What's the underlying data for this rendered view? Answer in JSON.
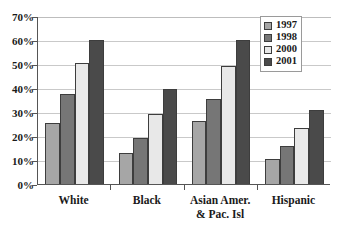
{
  "chart_data": {
    "type": "bar",
    "title": "",
    "subtitle": "",
    "xlabel": "",
    "ylabel": "",
    "categories": [
      "White",
      "Black",
      "Asian Amer. & Pac. Isl",
      "Hispanic"
    ],
    "category_lines": [
      [
        "White"
      ],
      [
        "Black"
      ],
      [
        "Asian Amer.",
        "& Pac. Isl"
      ],
      [
        "Hispanic"
      ]
    ],
    "series": [
      {
        "name": "1997",
        "color": "#a6a6a6",
        "values": [
          25.3,
          13.0,
          26.2,
          10.6
        ]
      },
      {
        "name": "1998",
        "color": "#767676",
        "values": [
          37.7,
          19.0,
          35.6,
          16.0
        ]
      },
      {
        "name": "2000",
        "color": "#e8e8e8",
        "values": [
          50.5,
          29.0,
          49.0,
          23.2
        ]
      },
      {
        "name": "2001",
        "color": "#4a4a4a",
        "values": [
          60.0,
          39.6,
          60.2,
          31.0
        ]
      }
    ],
    "ylim": [
      0,
      70
    ],
    "yticks": [
      0,
      10,
      20,
      30,
      40,
      50,
      60,
      70
    ],
    "ytick_labels": [
      "0%",
      "10%",
      "20%",
      "30%",
      "40%",
      "50%",
      "60%",
      "70%"
    ],
    "grid": true,
    "grid_axis": "y",
    "legend_position": "top-right",
    "legend_entries": [
      "1997",
      "1998",
      "2000",
      "2001"
    ],
    "axis_color": "#555555",
    "grid_color": "#c9c9c9",
    "bar_border_color": "#3d3d3d",
    "background": "#ffffff"
  }
}
